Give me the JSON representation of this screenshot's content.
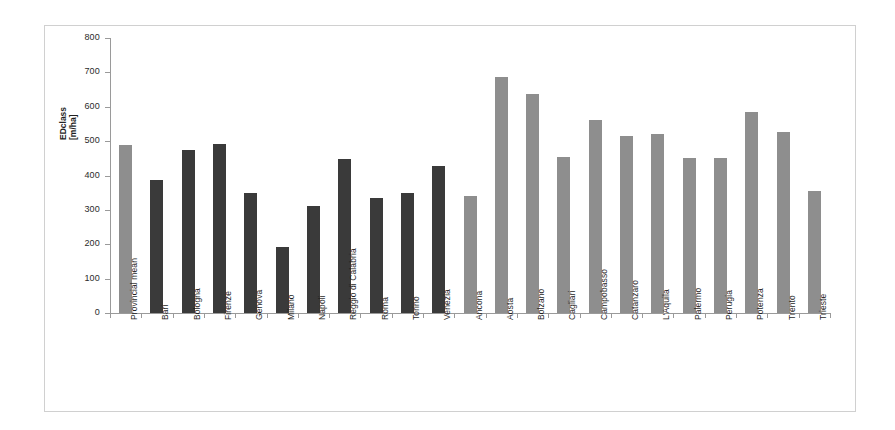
{
  "chart_data": {
    "type": "bar",
    "title": "",
    "subtitle": "",
    "xlabel": "",
    "ylabel": "EDclass [m/ha]",
    "ylabel_lines": [
      "EDclass",
      "[m/ha]"
    ],
    "ylim": [
      0,
      800
    ],
    "ytick_labels": [
      "800",
      "700",
      "600",
      "500",
      "400",
      "300",
      "200",
      "100",
      "0"
    ],
    "ytick_values": [
      800,
      700,
      600,
      500,
      400,
      300,
      200,
      100,
      0
    ],
    "grid": false,
    "legend": "none",
    "categories": [
      "Provincial mean",
      "Bari",
      "Bologna",
      "Firenze",
      "Genova",
      "Milano",
      "Napoli",
      "Reggio di Calabria",
      "Roma",
      "Torino",
      "Venezia",
      "Ancona",
      "Aosta",
      "Bolzano",
      "Cagliari",
      "Campobasso",
      "Catanzaro",
      "L'Aquila",
      "Palermo",
      "Perugia",
      "Potenza",
      "Trento",
      "Trieste"
    ],
    "values": [
      490,
      387,
      475,
      492,
      348,
      193,
      310,
      448,
      336,
      348,
      427,
      341,
      688,
      638,
      455,
      562,
      515,
      520,
      450,
      450,
      585,
      528,
      355
    ],
    "bar_colors": [
      "#8e8e8e",
      "#3a3a3a",
      "#3a3a3a",
      "#3a3a3a",
      "#3a3a3a",
      "#3a3a3a",
      "#3a3a3a",
      "#3a3a3a",
      "#3a3a3a",
      "#3a3a3a",
      "#3a3a3a",
      "#8e8e8e",
      "#8e8e8e",
      "#8e8e8e",
      "#8e8e8e",
      "#8e8e8e",
      "#8e8e8e",
      "#8e8e8e",
      "#8e8e8e",
      "#8e8e8e",
      "#8e8e8e",
      "#8e8e8e",
      "#8e8e8e"
    ],
    "colors": {
      "dark_bar": "#3a3a3a",
      "light_bar": "#8e8e8e",
      "axis": "#9a9a9a",
      "frame": "#d0d0d0",
      "text": "#1f1f1f",
      "background": "#ffffff"
    }
  }
}
